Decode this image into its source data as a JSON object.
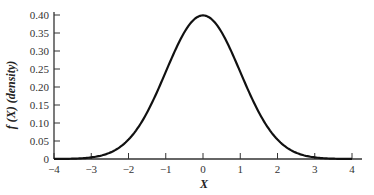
{
  "chart_data": {
    "type": "line",
    "title": "",
    "xlabel": "X",
    "ylabel": "f (X) (density)",
    "xlim": [
      -4,
      4
    ],
    "ylim": [
      0,
      0.4
    ],
    "x_ticks": [
      "-4",
      "-3",
      "-2",
      "-1",
      "0",
      "1",
      "2",
      "3",
      "4"
    ],
    "y_ticks": [
      "0",
      "0.05",
      "0.10",
      "0.15",
      "0.20",
      "0.25",
      "0.30",
      "0.35",
      "0.40"
    ],
    "grid": false,
    "legend": null,
    "series": [
      {
        "name": "Standard normal density",
        "x": [
          -4,
          -3.5,
          -3,
          -2.5,
          -2,
          -1.5,
          -1,
          -0.5,
          0,
          0.5,
          1,
          1.5,
          2,
          2.5,
          3,
          3.5,
          4
        ],
        "values": [
          0.0001,
          0.0009,
          0.0044,
          0.0175,
          0.054,
          0.1295,
          0.242,
          0.3521,
          0.3989,
          0.3521,
          0.242,
          0.1295,
          0.054,
          0.0175,
          0.0044,
          0.0009,
          0.0001
        ]
      }
    ]
  },
  "colors": {
    "curve": "#111111",
    "axis": "#333333",
    "background": "#ffffff"
  }
}
